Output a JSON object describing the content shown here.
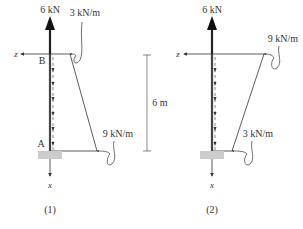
{
  "diagrams": [
    {
      "caption": "(1)",
      "point_load": "6 kN",
      "top_load": "3 kN/m",
      "bottom_load": "9 kN/m",
      "top_point": "B",
      "bottom_point": "A",
      "axis_z": "z",
      "axis_x": "x"
    },
    {
      "caption": "(2)",
      "point_load": "6 kN",
      "top_load": "9 kN/m",
      "bottom_load": "3 kN/m",
      "axis_z": "z",
      "axis_x": "x"
    }
  ],
  "dimension": {
    "length": "6 m"
  },
  "colors": {
    "line": "#333333",
    "support": "#cccccc",
    "column": "#444444"
  }
}
